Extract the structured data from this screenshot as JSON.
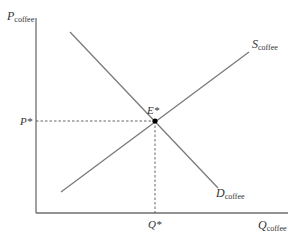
{
  "diagram": {
    "type": "supply-demand",
    "y_axis": {
      "label": "P",
      "subscript": "coffee"
    },
    "x_axis": {
      "label": "Q",
      "subscript": "coffee"
    },
    "supply": {
      "label": "S",
      "subscript": "coffee"
    },
    "demand": {
      "label": "D",
      "subscript": "coffee"
    },
    "equilibrium": {
      "label": "E*",
      "price_label": "P*",
      "quantity_label": "Q*"
    },
    "colors": {
      "line": "#7a7a7a",
      "axis": "#6e6e6e",
      "point": "#000000",
      "text": "#333333"
    }
  }
}
